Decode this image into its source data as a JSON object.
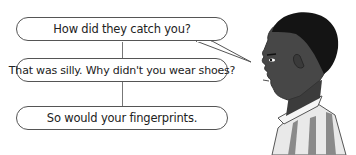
{
  "dialogue": {
    "lines": [
      {
        "text": "How did they catch you?"
      },
      {
        "text": "That was silly. Why didn't you wear shoes?"
      },
      {
        "text": "So would your fingerprints."
      }
    ]
  },
  "figure": {
    "shirt_stripe_colors": [
      "#ffffff",
      "#8a8a8a"
    ],
    "skin_color": "#4a4a4a",
    "hair_color": "#111111"
  }
}
